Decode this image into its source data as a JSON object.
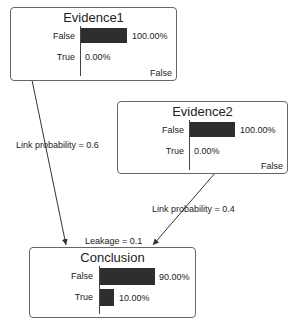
{
  "nodes": {
    "evidence1": {
      "title": "Evidence1",
      "states": [
        {
          "label": "False",
          "value": 100.0,
          "pct": "100.00%"
        },
        {
          "label": "True",
          "value": 0.0,
          "pct": "0.00%"
        }
      ],
      "observed_state": "False"
    },
    "evidence2": {
      "title": "Evidence2",
      "states": [
        {
          "label": "False",
          "value": 100.0,
          "pct": "100.00%"
        },
        {
          "label": "True",
          "value": 0.0,
          "pct": "0.00%"
        }
      ],
      "observed_state": "False"
    },
    "conclusion": {
      "title": "Conclusion",
      "states": [
        {
          "label": "False",
          "value": 90.0,
          "pct": "90.00%"
        },
        {
          "label": "True",
          "value": 10.0,
          "pct": "10.00%"
        }
      ]
    }
  },
  "links": [
    {
      "from": "Evidence1",
      "to": "Conclusion",
      "label": "Link probability = 0.6"
    },
    {
      "from": "Evidence2",
      "to": "Conclusion",
      "label": "Link probability = 0.4"
    }
  ],
  "leakage_label": "Leakage = 0.1",
  "colors": {
    "bar": "#2e2e2e",
    "border": "#666666",
    "arrow": "#333333"
  }
}
